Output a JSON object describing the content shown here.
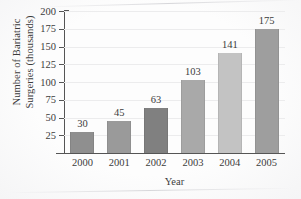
{
  "chart_data": {
    "type": "bar",
    "title": "",
    "xlabel": "Year",
    "ylabel_line1": "Number of Bariatric",
    "ylabel_line2": "Surgeries (thousands)",
    "categories": [
      "2000",
      "2001",
      "2002",
      "2003",
      "2004",
      "2005"
    ],
    "values": [
      30,
      45,
      63,
      103,
      141,
      175
    ],
    "value_labels": [
      "30",
      "45",
      "63",
      "103",
      "141",
      "175"
    ],
    "bar_colors": [
      "#8f8f8f",
      "#9a9a9a",
      "#808080",
      "#a9a9a9",
      "#c3c3c3",
      "#9e9e9e"
    ],
    "ylim": [
      0,
      200
    ],
    "ytick_values": [
      25,
      50,
      75,
      100,
      125,
      150,
      175,
      200
    ],
    "ytick_labels": [
      "25",
      "50",
      "75",
      "100",
      "125",
      "150",
      "175",
      "200"
    ],
    "grid": true,
    "grid_axis": "y",
    "legend": false,
    "legend_position": "none",
    "axis_color": "#555555",
    "grid_color": "#ececed",
    "text_color": "#3c3c3c",
    "background": "#fdfdfd"
  }
}
